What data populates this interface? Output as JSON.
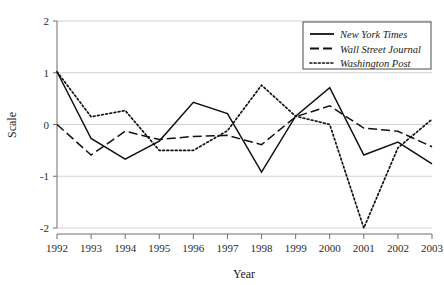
{
  "chart_data": {
    "type": "line",
    "title": "",
    "xlabel": "Year",
    "ylabel": "Scale",
    "categories": [
      "1992",
      "1993",
      "1994",
      "1995",
      "1996",
      "1997",
      "1998",
      "1999",
      "2000",
      "2001",
      "2002",
      "2003"
    ],
    "x": [
      1992,
      1993,
      1994,
      1995,
      1996,
      1997,
      1998,
      1999,
      2000,
      2001,
      2002,
      2003
    ],
    "xlim": [
      1992,
      2003
    ],
    "ylim": [
      -2,
      2
    ],
    "yticks": [
      2,
      1,
      0,
      -1,
      -2
    ],
    "ytick_labels": [
      "2",
      "1",
      "0",
      "-1",
      "-2"
    ],
    "grid": true,
    "grid_axis": "y",
    "legend_position": "top-right",
    "series": [
      {
        "name": "New York Times",
        "style": "solid",
        "color": "#111111",
        "values": [
          1.02,
          -0.27,
          -0.67,
          -0.32,
          0.43,
          0.21,
          -0.92,
          0.16,
          0.71,
          -0.59,
          -0.34,
          -0.76
        ]
      },
      {
        "name": "Wall Street Journal",
        "style": "dashed",
        "color": "#111111",
        "values": [
          0.0,
          -0.59,
          -0.13,
          -0.29,
          -0.23,
          -0.21,
          -0.39,
          0.15,
          0.36,
          -0.07,
          -0.13,
          -0.43
        ]
      },
      {
        "name": "Washington Post",
        "style": "dotted",
        "color": "#111111",
        "values": [
          1.02,
          0.15,
          0.27,
          -0.5,
          -0.5,
          -0.12,
          0.76,
          0.16,
          0.0,
          -2.0,
          -0.45,
          0.1
        ]
      }
    ]
  },
  "axes": {
    "y_title": "Scale",
    "x_title": "Year",
    "y_tick_labels": [
      "2",
      "1",
      "0",
      "-1",
      "-2"
    ],
    "x_tick_labels": [
      "1992",
      "1993",
      "1994",
      "1995",
      "1996",
      "1997",
      "1998",
      "1999",
      "2000",
      "2001",
      "2002",
      "2003"
    ]
  },
  "legend": {
    "entries": [
      {
        "label": "New York Times",
        "style": "solid"
      },
      {
        "label": "Wall Street Journal",
        "style": "dashed"
      },
      {
        "label": "Washington Post",
        "style": "dotted"
      }
    ]
  },
  "colors": {
    "line": "#111111",
    "grid": "#d2d2d2",
    "axis": "#6e6e6e",
    "text": "#1a1a1a",
    "background": "#ffffff"
  }
}
